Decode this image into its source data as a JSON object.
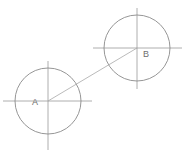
{
  "figure": {
    "type": "geometric-construction-drawing",
    "canvas": {
      "width": 189,
      "height": 153,
      "background": "#ffffff"
    },
    "style": {
      "circle_stroke": "#8a8a8a",
      "circle_stroke_width": 0.9,
      "centerline_stroke": "#9a9a9a",
      "centerline_stroke_width": 0.8,
      "connector_stroke": "#a8a8a8",
      "connector_stroke_width": 0.8,
      "label_color": "#6e6e6e",
      "label_font_size": 9
    },
    "circles": [
      {
        "id": "circle-a",
        "label": "A",
        "cx": 48,
        "cy": 101,
        "r": 33,
        "label_x": 38,
        "label_y": 105,
        "label_anchor": "end",
        "centerline_h": {
          "x1": 3,
          "y1": 101,
          "x2": 92,
          "y2": 101
        },
        "centerline_v": {
          "x1": 48,
          "y1": 61,
          "x2": 48,
          "y2": 150
        }
      },
      {
        "id": "circle-b",
        "label": "B",
        "cx": 137,
        "cy": 48,
        "r": 33,
        "label_x": 143,
        "label_y": 57,
        "label_anchor": "start",
        "centerline_h": {
          "x1": 93,
          "y1": 48,
          "x2": 182,
          "y2": 48
        },
        "centerline_v": {
          "x1": 137,
          "y1": 8,
          "x2": 137,
          "y2": 89
        }
      }
    ],
    "connector": {
      "id": "center-to-center-line",
      "label": "",
      "x1": 48,
      "y1": 101,
      "x2": 137,
      "y2": 48
    }
  }
}
